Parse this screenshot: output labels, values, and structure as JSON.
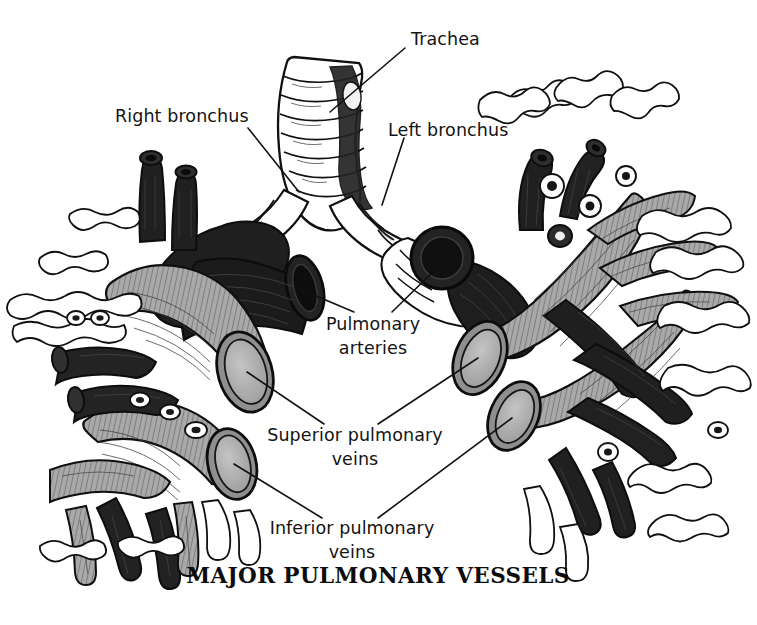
{
  "figure": {
    "title": "MAJOR PULMONARY VESSELS",
    "background_color": "#ffffff",
    "ink_color": "#111111",
    "medium": "black-and-white anatomical line illustration"
  },
  "labels": {
    "trachea": "Trachea",
    "right_bronchus": "Right bronchus",
    "left_bronchus": "Left bronchus",
    "pulmonary_arteries_line1": "Pulmonary",
    "pulmonary_arteries_line2": "arteries",
    "superior_veins_line1": "Superior pulmonary",
    "superior_veins_line2": "veins",
    "inferior_veins_line1": "Inferior pulmonary",
    "inferior_veins_line2": "veins"
  },
  "structures": {
    "artery_fill": "#1c1c1c",
    "vein_fill": "#a9a9a9",
    "vein_lumen": "#b3b3b3",
    "bronchus_fill": "#ffffff",
    "outline": "#101010",
    "legend": [
      {
        "name": "Pulmonary arteries",
        "tone": "black",
        "hex": "#1c1c1c"
      },
      {
        "name": "Pulmonary veins",
        "tone": "mid gray",
        "hex": "#a9a9a9"
      },
      {
        "name": "Trachea and bronchi",
        "tone": "white with cartilage rings",
        "hex": "#ffffff"
      }
    ]
  }
}
